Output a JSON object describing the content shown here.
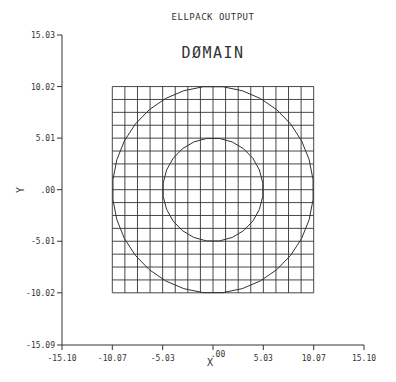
{
  "chart_data": {
    "type": "line",
    "title": "ELLPACK OUTPUT",
    "subtitle": "DØMAIN",
    "xlabel": "X",
    "ylabel": "Y",
    "xlim": [
      -15.1,
      15.1
    ],
    "ylim": [
      -15.09,
      15.03
    ],
    "x_ticks": [
      "-15.10",
      "-10.07",
      "-5.03",
      ".00",
      "5.03",
      "10.07",
      "15.10"
    ],
    "y_ticks": [
      "15.03",
      "10.02",
      "5.01",
      ".00",
      "-5.01",
      "-10.02",
      "-15.09"
    ],
    "grid": {
      "x_range": [
        -10.07,
        10.07
      ],
      "y_range": [
        -10.02,
        10.02
      ],
      "cells_x": 16,
      "cells_y": 16
    },
    "shapes": [
      {
        "name": "outer-circle",
        "center": [
          0,
          0
        ],
        "radius": 10.05,
        "segments": 32
      },
      {
        "name": "inner-circle",
        "center": [
          0,
          0
        ],
        "radius": 5.02,
        "segments": 24
      }
    ],
    "legend": null
  },
  "colors": {
    "line": "#333333",
    "background": "#ffffff"
  }
}
